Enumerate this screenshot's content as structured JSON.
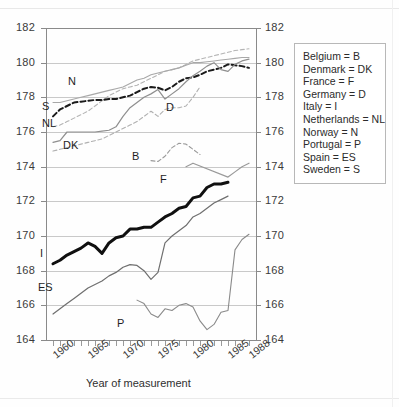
{
  "axes": {
    "y_ticks": [
      164,
      166,
      168,
      170,
      172,
      174,
      176,
      178,
      180,
      182
    ],
    "x_major_labels": [
      "1960",
      "1965",
      "1970",
      "1975",
      "1980",
      "1985",
      "1988"
    ],
    "x_title": "Year of measurement"
  },
  "legend": {
    "entries": [
      "Belgium = B",
      "Denmark = DK",
      "France = F",
      "Germany = D",
      "Italy = I",
      "Netherlands = NL",
      "Norway = N",
      "Portugal = P",
      "Spain = ES",
      "Sweden = S"
    ]
  },
  "series_labels": [
    {
      "code": "N",
      "x": 68,
      "y": 75
    },
    {
      "code": "S",
      "x": 42,
      "y": 100
    },
    {
      "code": "NL",
      "x": 42,
      "y": 117
    },
    {
      "code": "DK",
      "x": 63,
      "y": 139
    },
    {
      "code": "D",
      "x": 166,
      "y": 101
    },
    {
      "code": "B",
      "x": 132,
      "y": 150
    },
    {
      "code": "F",
      "x": 160,
      "y": 173
    },
    {
      "code": "I",
      "x": 40,
      "y": 247
    },
    {
      "code": "ES",
      "x": 38,
      "y": 281
    },
    {
      "code": "P",
      "x": 117,
      "y": 317
    }
  ],
  "chart_data": {
    "type": "line",
    "title": "",
    "subtitle": "",
    "xlabel": "Year of measurement",
    "ylabel": "",
    "xlim": [
      1959,
      1989
    ],
    "ylim": [
      164,
      182
    ],
    "ytick_step": 2,
    "grid": "horizontal",
    "legend_position": "right-outside",
    "y_unit": "cm (mean height)",
    "axis_note": "Identical y scale labelled on both left and right axes",
    "series": [
      {
        "name": "Netherlands",
        "code": "NL",
        "style": "dashed",
        "color": "#b4b4b4",
        "width": 1.1,
        "x": [
          1960,
          1961,
          1962,
          1963,
          1964,
          1965,
          1966,
          1967,
          1968,
          1969,
          1970,
          1971,
          1972,
          1973,
          1974,
          1975,
          1976,
          1977,
          1978,
          1979,
          1980,
          1981,
          1982,
          1983,
          1984,
          1985,
          1986,
          1987,
          1988
        ],
        "y": [
          176.3,
          176.4,
          176.6,
          176.8,
          177.0,
          177.2,
          177.5,
          177.8,
          178.1,
          178.3,
          178.5,
          178.6,
          178.7,
          178.9,
          179.1,
          179.3,
          179.5,
          179.6,
          179.7,
          179.9,
          180.1,
          180.2,
          180.3,
          180.4,
          180.5,
          180.6,
          180.7,
          180.75,
          180.8
        ]
      },
      {
        "name": "Norway",
        "code": "N",
        "style": "solid",
        "color": "#a8a8a8",
        "width": 1.1,
        "x": [
          1960,
          1961,
          1962,
          1963,
          1964,
          1965,
          1966,
          1967,
          1968,
          1969,
          1970,
          1971,
          1972,
          1973,
          1974,
          1975,
          1976,
          1977,
          1978,
          1979,
          1980,
          1981,
          1982,
          1983,
          1984,
          1985,
          1986,
          1987,
          1988
        ],
        "y": [
          177.7,
          177.7,
          177.8,
          177.9,
          178.0,
          178.1,
          178.2,
          178.3,
          178.4,
          178.5,
          178.6,
          178.8,
          179.0,
          179.1,
          179.3,
          179.4,
          179.5,
          179.6,
          179.7,
          179.85,
          180.0,
          180.0,
          180.05,
          180.1,
          180.15,
          180.2,
          180.25,
          180.3,
          180.3
        ]
      },
      {
        "name": "Sweden",
        "code": "S",
        "style": "dashed",
        "color": "#1a1a1a",
        "width": 2.0,
        "x": [
          1960,
          1961,
          1962,
          1963,
          1964,
          1965,
          1966,
          1967,
          1968,
          1969,
          1970,
          1971,
          1972,
          1973,
          1974,
          1975,
          1976,
          1977,
          1978,
          1979,
          1980,
          1981,
          1982,
          1983,
          1984,
          1985,
          1986,
          1987,
          1988
        ],
        "y": [
          176.9,
          177.3,
          177.5,
          177.7,
          177.75,
          177.8,
          177.85,
          177.85,
          177.9,
          177.9,
          178.0,
          178.1,
          178.3,
          178.5,
          178.6,
          178.55,
          178.4,
          178.6,
          178.9,
          179.1,
          179.15,
          179.3,
          179.5,
          179.6,
          179.7,
          179.9,
          179.85,
          179.8,
          179.7
        ]
      },
      {
        "name": "Denmark",
        "code": "DK",
        "style": "solid",
        "color": "#8f8f8f",
        "width": 1.2,
        "x": [
          1960,
          1961,
          1962,
          1963,
          1964,
          1965,
          1966,
          1967,
          1968,
          1969,
          1970,
          1971,
          1972,
          1973,
          1974,
          1975,
          1976,
          1977,
          1978,
          1979,
          1980,
          1981,
          1982,
          1983,
          1984,
          1985,
          1986,
          1987,
          1988
        ],
        "y": [
          175.4,
          175.5,
          176.0,
          176.0,
          176.0,
          176.0,
          176.0,
          176.05,
          176.1,
          176.3,
          176.9,
          177.4,
          177.7,
          178.0,
          178.2,
          178.45,
          177.9,
          178.2,
          178.5,
          178.9,
          179.25,
          179.5,
          179.8,
          180.0,
          179.6,
          179.5,
          179.9,
          180.1,
          180.2
        ]
      },
      {
        "name": "Germany",
        "code": "D",
        "style": "dashed",
        "color": "#b0b0b0",
        "width": 1.1,
        "x": [
          1960,
          1961,
          1962,
          1963,
          1964,
          1965,
          1966,
          1967,
          1968,
          1969,
          1970,
          1971,
          1972,
          1973,
          1974,
          1975,
          1976,
          1977,
          1978,
          1979,
          1980,
          1981
        ],
        "y": [
          174.9,
          175.0,
          175.1,
          175.2,
          175.3,
          175.4,
          175.5,
          175.6,
          175.8,
          176.0,
          176.2,
          176.4,
          176.6,
          176.9,
          177.2,
          176.9,
          177.3,
          177.4,
          177.4,
          177.5,
          178.0,
          178.6
        ]
      },
      {
        "name": "Belgium",
        "code": "B",
        "style": "dashed",
        "color": "#9a9a9a",
        "width": 1.1,
        "x": [
          1974,
          1975,
          1976,
          1977,
          1978,
          1979,
          1980,
          1981
        ],
        "y": [
          174.35,
          174.3,
          174.6,
          175.1,
          175.35,
          175.3,
          175.0,
          174.7
        ]
      },
      {
        "name": "France",
        "code": "F",
        "style": "solid",
        "color": "#9a9a9a",
        "width": 1.2,
        "x": [
          1979,
          1980,
          1985,
          1986,
          1987,
          1988
        ],
        "y": [
          174.0,
          174.2,
          173.4,
          173.7,
          174.0,
          174.2
        ]
      },
      {
        "name": "Italy",
        "code": "I",
        "style": "solid",
        "color": "#101010",
        "width": 3.0,
        "x": [
          1960,
          1961,
          1962,
          1963,
          1964,
          1965,
          1966,
          1967,
          1968,
          1969,
          1970,
          1971,
          1972,
          1973,
          1974,
          1975,
          1976,
          1977,
          1978,
          1979,
          1980,
          1981,
          1982,
          1983,
          1984,
          1985
        ],
        "y": [
          168.4,
          168.6,
          168.9,
          169.1,
          169.3,
          169.6,
          169.4,
          169.0,
          169.6,
          169.9,
          170.0,
          170.4,
          170.4,
          170.5,
          170.5,
          170.8,
          171.1,
          171.3,
          171.6,
          171.7,
          172.2,
          172.3,
          172.8,
          173.0,
          173.0,
          173.1
        ]
      },
      {
        "name": "Spain",
        "code": "ES",
        "style": "solid",
        "color": "#6f6f6f",
        "width": 1.2,
        "x": [
          1960,
          1961,
          1962,
          1963,
          1964,
          1965,
          1966,
          1967,
          1968,
          1969,
          1970,
          1971,
          1972,
          1973,
          1974,
          1975,
          1976,
          1977,
          1978,
          1979,
          1980,
          1981,
          1982,
          1983,
          1984,
          1985
        ],
        "y": [
          165.5,
          165.8,
          166.1,
          166.4,
          166.7,
          167.0,
          167.2,
          167.4,
          167.7,
          167.9,
          168.2,
          168.35,
          168.3,
          168.0,
          167.5,
          167.9,
          169.6,
          170.0,
          170.3,
          170.6,
          171.1,
          171.3,
          171.6,
          171.9,
          172.1,
          172.3
        ]
      },
      {
        "name": "Portugal",
        "code": "P",
        "style": "dashdot",
        "color": "#8a8a8a",
        "width": 1.1,
        "x": [
          1972,
          1973,
          1974,
          1975,
          1976,
          1977,
          1978,
          1979,
          1980,
          1981,
          1982,
          1983,
          1984,
          1985,
          1986,
          1987,
          1988
        ],
        "y": [
          166.3,
          166.1,
          165.5,
          165.3,
          165.8,
          165.7,
          166.0,
          166.1,
          165.9,
          165.1,
          164.6,
          164.9,
          165.6,
          165.7,
          169.2,
          169.8,
          170.1
        ]
      }
    ]
  }
}
